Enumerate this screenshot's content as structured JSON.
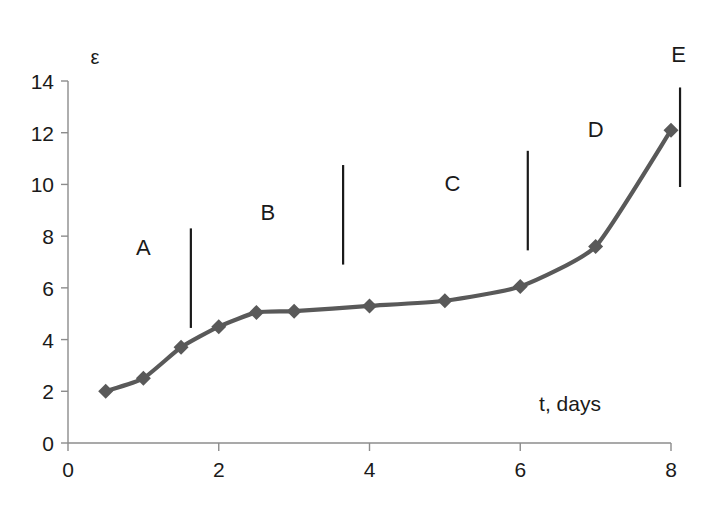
{
  "chart_data": {
    "type": "line",
    "title": "",
    "xlabel": "t, days",
    "ylabel": "ε",
    "xlim": [
      0,
      8.2
    ],
    "ylim": [
      0,
      14
    ],
    "grid": false,
    "legend": "none",
    "marker": "diamond",
    "line_color": "#595959",
    "marker_color": "#595959",
    "x_ticks": [
      0,
      2,
      4,
      6,
      8
    ],
    "x_tick_labels": [
      "0",
      "2",
      "4",
      "6",
      "8"
    ],
    "y_ticks": [
      0,
      2,
      4,
      6,
      8,
      10,
      12,
      14
    ],
    "y_tick_labels": [
      "0",
      "2",
      "4",
      "6",
      "8",
      "10",
      "12",
      "14"
    ],
    "series": [
      {
        "name": "strain",
        "x": [
          0.5,
          1.0,
          1.5,
          2.0,
          2.5,
          3.0,
          4.0,
          5.0,
          6.0,
          7.0,
          8.0
        ],
        "values": [
          2.0,
          2.5,
          3.7,
          4.5,
          5.05,
          5.1,
          5.3,
          5.5,
          6.05,
          7.6,
          12.1
        ]
      }
    ],
    "dividers": [
      {
        "x": 1.63,
        "y_top": 8.3,
        "y_bottom": 4.45
      },
      {
        "x": 3.65,
        "y_top": 10.75,
        "y_bottom": 6.9
      },
      {
        "x": 6.1,
        "y_top": 11.3,
        "y_bottom": 7.45
      },
      {
        "x": 8.12,
        "y_top": 13.75,
        "y_bottom": 9.9
      }
    ],
    "annotations": [
      {
        "label": "A",
        "x": 1.0,
        "y": 7.55
      },
      {
        "label": "B",
        "x": 2.65,
        "y": 8.9
      },
      {
        "label": "C",
        "x": 5.1,
        "y": 10.0
      },
      {
        "label": "D",
        "x": 7.0,
        "y": 12.1
      },
      {
        "label": "E",
        "x": 8.1,
        "y": 15.0
      }
    ],
    "axis_label_positions": {
      "ylabel_x": 95,
      "ylabel_y": 57,
      "xlabel_x": 570,
      "xlabel_y": 403
    }
  }
}
